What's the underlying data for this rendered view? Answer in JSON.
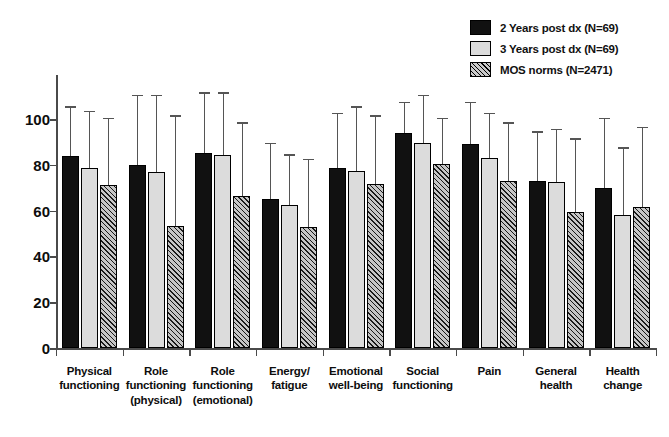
{
  "chart_data": {
    "type": "bar",
    "title": "",
    "subtitle": "",
    "xlabel": "",
    "ylabel": "",
    "ylim": [
      0,
      110
    ],
    "yticks": [
      0,
      20,
      40,
      60,
      80,
      100
    ],
    "grid": false,
    "legend_position": "top-right",
    "orientation": "vertical",
    "grouping": "grouped",
    "error_bars": "upper whisker (standard deviation)",
    "categories": [
      "Physical functioning",
      "Role functioning (physical)",
      "Role functioning (emotional)",
      "Energy/ fatigue",
      "Emotional well-being",
      "Social functioning",
      "Pain",
      "General health",
      "Health change"
    ],
    "category_lines": [
      [
        "Physical",
        "functioning"
      ],
      [
        "Role",
        "functioning",
        "(physical)"
      ],
      [
        "Role",
        "functioning",
        "(emotional)"
      ],
      [
        "Energy/",
        "fatigue"
      ],
      [
        "Emotional",
        "well-being"
      ],
      [
        "Social",
        "functioning"
      ],
      [
        "Pain"
      ],
      [
        "General",
        "health"
      ],
      [
        "Health",
        "change"
      ]
    ],
    "series": [
      {
        "name": "2 Years post dx (N=69)",
        "swatch": "solid-black",
        "color": "#111111",
        "values": [
          84,
          80,
          85,
          65,
          78.5,
          94,
          89,
          73,
          70
        ],
        "errors_upper": [
          105,
          110,
          111,
          89,
          102,
          107,
          107,
          94,
          100
        ]
      },
      {
        "name": "3 Years post dx (N=69)",
        "swatch": "light-gray",
        "color": "#dcdcdc",
        "values": [
          78.5,
          77,
          84.5,
          62.5,
          77.5,
          89.5,
          83,
          72.5,
          58
        ],
        "errors_upper": [
          103,
          110,
          111,
          84,
          105,
          110,
          102,
          95,
          87
        ]
      },
      {
        "name": "MOS norms (N=2471)",
        "swatch": "diagonal-hatch",
        "color": "#c6c6c6",
        "values": [
          71,
          53.5,
          66.5,
          53,
          71.5,
          80.5,
          73,
          59.5,
          61.5
        ],
        "errors_upper": [
          100,
          101,
          98,
          82,
          101,
          100,
          98,
          91,
          96
        ]
      }
    ]
  },
  "legend": {
    "items": [
      {
        "label": "2 Years post dx (N=69)",
        "swatch": "solid-black"
      },
      {
        "label": "3 Years post dx (N=69)",
        "swatch": "light-gray"
      },
      {
        "label": "MOS norms (N=2471)",
        "swatch": "diagonal-hatch"
      }
    ]
  },
  "axis": {
    "y_tick_labels": [
      "0",
      "20",
      "40",
      "60",
      "80",
      "100"
    ]
  }
}
